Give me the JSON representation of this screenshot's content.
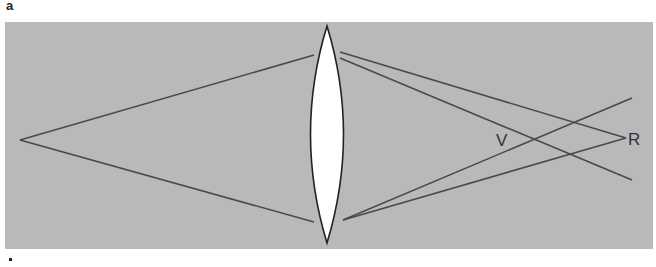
{
  "figure": {
    "panel_label": "a",
    "background_color": "#b9b9b9",
    "line_color": "#4a4a4a",
    "lens_fill": "#ffffff",
    "labels": {
      "virtual_point": "V",
      "real_point": "R"
    }
  }
}
